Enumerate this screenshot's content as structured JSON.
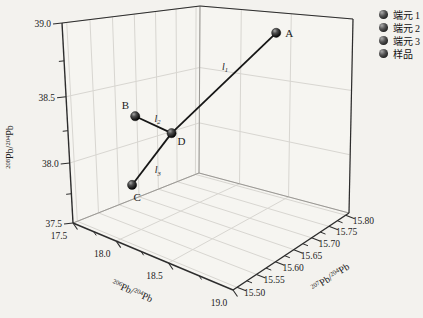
{
  "chart_data": {
    "type": "scatter3d",
    "title": "",
    "axes": {
      "x": {
        "iso_num": "206",
        "iso_mid": "Pb/",
        "iso_den": "204",
        "iso_end": "Pb",
        "range": [
          17.5,
          19.0
        ],
        "ticks": [
          17.5,
          18.0,
          18.5,
          19.0
        ],
        "tick_labels": [
          "17.5",
          "18.0",
          "18.5",
          "19.0"
        ]
      },
      "y": {
        "iso_num": "207",
        "iso_mid": "Pb/",
        "iso_den": "204",
        "iso_end": "Pb",
        "range": [
          15.49,
          15.81
        ],
        "ticks": [
          15.5,
          15.55,
          15.6,
          15.65,
          15.7,
          15.75,
          15.8
        ],
        "tick_labels": [
          "15.50",
          "15.55",
          "15.60",
          "15.65",
          "15.70",
          "15.75",
          "15.80"
        ]
      },
      "z": {
        "iso_num": "208",
        "iso_mid": "Pb/",
        "iso_den": "204",
        "iso_end": "Pb",
        "range": [
          37.5,
          39.0
        ],
        "ticks": [
          37.5,
          38.0,
          38.5,
          39.0
        ],
        "tick_labels": [
          "37.5",
          "38.0",
          "38.5",
          "39.0"
        ]
      }
    },
    "points": [
      {
        "name": "A",
        "x": 18.62,
        "y": 15.73,
        "z": 38.93
      },
      {
        "name": "B",
        "x": 17.83,
        "y": 15.58,
        "z": 38.34
      },
      {
        "name": "C",
        "x": 17.82,
        "y": 15.57,
        "z": 37.8
      },
      {
        "name": "D",
        "x": 18.04,
        "y": 15.62,
        "z": 38.21
      }
    ],
    "lines": [
      {
        "from": "A",
        "to": "D",
        "label": "l",
        "sub": "1"
      },
      {
        "from": "B",
        "to": "D",
        "label": "l",
        "sub": "2"
      },
      {
        "from": "C",
        "to": "D",
        "label": "l",
        "sub": "3"
      }
    ],
    "legend": [
      {
        "label": "端元 1"
      },
      {
        "label": "端元 2"
      },
      {
        "label": "端元 3"
      },
      {
        "label": "样品"
      }
    ],
    "colors": {
      "background": "#f3f2ee",
      "pane": "#f6f5f1",
      "grid": "#d8d6d1",
      "edge_dark": "#2d2d2d",
      "edge_back": "#9b9995",
      "line": "#161616",
      "marker": "#0a0a0a",
      "text": "#1c1c1c"
    }
  }
}
